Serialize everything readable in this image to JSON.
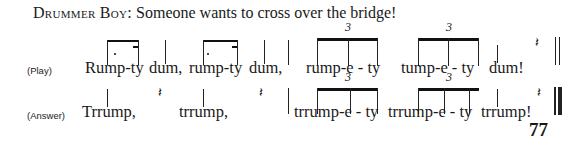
{
  "header": {
    "speaker": "Drummer Boy:",
    "text": "Someone wants to cross over the bridge!"
  },
  "lines": [
    {
      "label": "(Play)",
      "words": [
        "Rump-ty",
        "dum,",
        "rump-ty",
        "dum,",
        "rump-e - ty",
        "tump-e - ty",
        "dum!"
      ],
      "triplet_marks": [
        "3",
        "3"
      ],
      "rest_icon": "quarter-rest",
      "ending_icon": "double-barline"
    },
    {
      "label": "(Answer)",
      "words": [
        "Trrump,",
        "trrump,",
        "trrump-e - ty",
        "trrump-e - ty",
        "trrump!"
      ],
      "triplet_marks": [
        "3",
        "3"
      ],
      "rest_icon": "quarter-rest",
      "ending_icon": "final-barline"
    }
  ],
  "footer": {
    "page_number": "77"
  }
}
